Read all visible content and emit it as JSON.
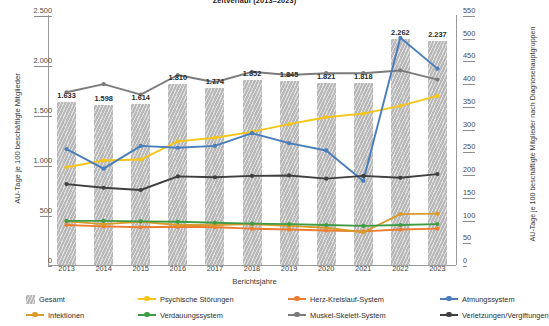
{
  "title": "Zeitverlauf (2013–2023)",
  "axes": {
    "x_title": "Berichtsjahre",
    "y_left_title": "AU-Tage je 100 beschäftigte Mitglieder",
    "y_right_title": "AU-Tage je 100 beschäftigte Mitglieder nach Diagnosehauptgruppen",
    "y_left_ticks": [
      "0",
      "500",
      "1.000",
      "1.500",
      "2.000",
      "2.500"
    ],
    "y_right_ticks": [
      "0",
      "50",
      "100",
      "150",
      "200",
      "250",
      "300",
      "350",
      "400",
      "450",
      "500",
      "550"
    ],
    "x_ticks": [
      "2013",
      "2014",
      "2015",
      "2016",
      "2017",
      "2018",
      "2019",
      "2020",
      "2021",
      "2022",
      "2023"
    ]
  },
  "bar_labels": [
    "1.633",
    "1.598",
    "1.614",
    "1.810",
    "1.774",
    "1.852",
    "1.845",
    "1.821",
    "1.818",
    "2.262",
    "2.237"
  ],
  "legend": [
    {
      "label": "Gesamt",
      "color": "#b9b9b9",
      "marker": "swatch"
    },
    {
      "label": "Psychische Störungen",
      "color": "#f5c518",
      "marker": "line"
    },
    {
      "label": "Herz-Kreislauf-System",
      "color": "#ed7d31",
      "marker": "line"
    },
    {
      "label": "Infektionen",
      "color": "#d99b2b",
      "marker": "line"
    },
    {
      "label": "Verdauungssystem",
      "color": "#3f9c45",
      "marker": "line"
    },
    {
      "label": "Muskel-Skelett-System",
      "color": "#7b7b7b",
      "marker": "line"
    },
    {
      "label": "Atmungssystem",
      "color": "#4a7ebb",
      "marker": "line"
    },
    {
      "label": "Verletzungen/Vergiftungen",
      "color": "#3f3f3f",
      "marker": "line"
    }
  ],
  "chart_data": {
    "type": "bar",
    "title": "Zeitverlauf (2013–2023)",
    "xlabel": "Berichtsjahre",
    "ylabel": "AU-Tage je 100 beschäftigte Mitglieder",
    "ylabel_secondary": "AU-Tage je 100 beschäftigte Mitglieder nach Diagnosehauptgruppen",
    "categories": [
      "2013",
      "2014",
      "2015",
      "2016",
      "2017",
      "2018",
      "2019",
      "2020",
      "2021",
      "2022",
      "2023"
    ],
    "ylim": [
      0,
      2500
    ],
    "ylim_secondary": [
      0,
      550
    ],
    "grid": false,
    "legend_position": "bottom",
    "bars": {
      "name": "Gesamt",
      "axis": "left",
      "color": "#b9b9b9",
      "values": [
        1633,
        1598,
        1614,
        1810,
        1774,
        1852,
        1845,
        1821,
        1818,
        2262,
        2237
      ],
      "labels": [
        "1.633",
        "1.598",
        "1.614",
        "1.810",
        "1.774",
        "1.852",
        "1.845",
        "1.821",
        "1.818",
        "2.262",
        "2.237"
      ]
    },
    "series": [
      {
        "name": "Psychische Störungen",
        "axis": "right",
        "color": "#f5c518",
        "values": [
          215,
          230,
          232,
          272,
          280,
          293,
          310,
          325,
          333,
          350,
          372
        ]
      },
      {
        "name": "Herz-Kreislauf-System",
        "axis": "right",
        "color": "#ed7d31",
        "values": [
          88,
          85,
          83,
          84,
          83,
          80,
          78,
          76,
          74,
          78,
          80
        ]
      },
      {
        "name": "Infektionen",
        "axis": "right",
        "color": "#d99b2b",
        "values": [
          96,
          90,
          95,
          88,
          88,
          90,
          86,
          82,
          72,
          112,
          113
        ]
      },
      {
        "name": "Verdauungssystem",
        "axis": "right",
        "color": "#3f9c45",
        "values": [
          97,
          97,
          96,
          95,
          93,
          91,
          90,
          88,
          86,
          88,
          90
        ]
      },
      {
        "name": "Muskel-Skelett-System",
        "axis": "right",
        "color": "#7b7b7b",
        "values": [
          380,
          398,
          375,
          418,
          402,
          425,
          418,
          422,
          422,
          428,
          408
        ]
      },
      {
        "name": "Atmungssystem",
        "axis": "right",
        "color": "#4a7ebb",
        "values": [
          255,
          212,
          262,
          258,
          262,
          290,
          268,
          252,
          185,
          500,
          432
        ]
      },
      {
        "name": "Verletzungen/Vergiftungen",
        "axis": "right",
        "color": "#3f3f3f",
        "values": [
          178,
          170,
          165,
          195,
          193,
          196,
          197,
          190,
          196,
          192,
          200
        ]
      }
    ]
  }
}
